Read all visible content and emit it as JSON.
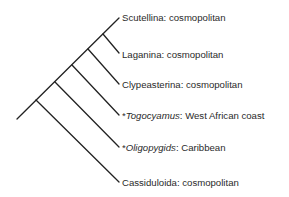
{
  "diagram": {
    "type": "cladogram",
    "line_color": "#222222",
    "taxa": [
      {
        "marker": "",
        "name": "Scutellina",
        "italic": false,
        "distribution": "cosmopolitan"
      },
      {
        "marker": "",
        "name": "Laganina",
        "italic": false,
        "distribution": "cosmopolitan"
      },
      {
        "marker": "",
        "name": "Clypeasterina",
        "italic": false,
        "distribution": "cosmopolitan"
      },
      {
        "marker": "*",
        "name": "Togocyamus",
        "italic": true,
        "distribution": "West African coast"
      },
      {
        "marker": "*",
        "name": "Oligopygids",
        "italic": true,
        "distribution": "Caribbean"
      },
      {
        "marker": "",
        "name": "Cassiduloida",
        "italic": false,
        "distribution": "cosmopolitan"
      }
    ],
    "separator": ": "
  }
}
